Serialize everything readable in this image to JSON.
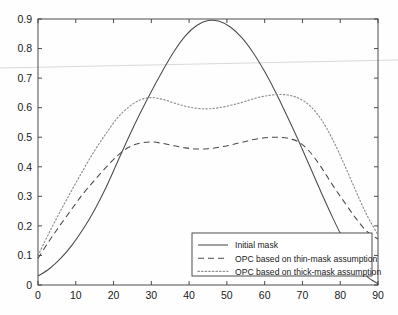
{
  "chart_data": {
    "type": "line",
    "title": "",
    "xlabel": "",
    "ylabel": "",
    "xlim": [
      0,
      90
    ],
    "ylim": [
      0,
      0.9
    ],
    "grid": false,
    "legend_position": "lower-right",
    "xticks": [
      "0",
      "10",
      "20",
      "30",
      "40",
      "50",
      "60",
      "70",
      "80",
      "90"
    ],
    "xtick_values": [
      0,
      10,
      20,
      30,
      40,
      50,
      60,
      70,
      80,
      90
    ],
    "yticks": [
      "0",
      "0.1",
      "0.2",
      "0.3",
      "0.4",
      "0.5",
      "0.6",
      "0.7",
      "0.8",
      "0.9"
    ],
    "ytick_values": [
      0,
      0.1,
      0.2,
      0.3,
      0.4,
      0.5,
      0.6,
      0.7,
      0.8,
      0.9
    ],
    "x": [
      0,
      3,
      6,
      9,
      12,
      15,
      18,
      21,
      24,
      27,
      30,
      33,
      36,
      39,
      42,
      45,
      48,
      51,
      54,
      57,
      60,
      63,
      66,
      69,
      72,
      75,
      78,
      81,
      84,
      87,
      90
    ],
    "series": [
      {
        "name": "Initial mask",
        "style": "solid",
        "color": "#4a4a4a",
        "values": [
          0.03,
          0.055,
          0.09,
          0.135,
          0.19,
          0.255,
          0.33,
          0.415,
          0.5,
          0.58,
          0.655,
          0.725,
          0.79,
          0.843,
          0.878,
          0.895,
          0.892,
          0.872,
          0.836,
          0.785,
          0.722,
          0.65,
          0.57,
          0.487,
          0.4,
          0.312,
          0.228,
          0.15,
          0.082,
          0.03,
          0.004
        ]
      },
      {
        "name": "OPC based on thin-mask assumption",
        "style": "dashed",
        "color": "#4a4a4a",
        "values": [
          0.09,
          0.15,
          0.205,
          0.258,
          0.31,
          0.355,
          0.398,
          0.437,
          0.466,
          0.48,
          0.484,
          0.479,
          0.471,
          0.464,
          0.46,
          0.461,
          0.466,
          0.474,
          0.483,
          0.492,
          0.498,
          0.5,
          0.497,
          0.484,
          0.45,
          0.398,
          0.338,
          0.282,
          0.228,
          0.182,
          0.155
        ]
      },
      {
        "name": "OPC based on thick-mask assumption",
        "style": "dotted",
        "color": "#8e8e8e",
        "values": [
          0.1,
          0.178,
          0.252,
          0.322,
          0.39,
          0.455,
          0.512,
          0.565,
          0.602,
          0.626,
          0.634,
          0.628,
          0.616,
          0.605,
          0.598,
          0.596,
          0.6,
          0.608,
          0.618,
          0.63,
          0.639,
          0.644,
          0.643,
          0.632,
          0.606,
          0.56,
          0.492,
          0.41,
          0.322,
          0.238,
          0.17
        ]
      }
    ]
  },
  "legend": {
    "entries": [
      {
        "label": "Initial mask",
        "style": "solid"
      },
      {
        "label": "OPC based on thin-mask assumption",
        "style": "dashed"
      },
      {
        "label": "OPC based on thick-mask assumption",
        "style": "dotted"
      }
    ]
  }
}
